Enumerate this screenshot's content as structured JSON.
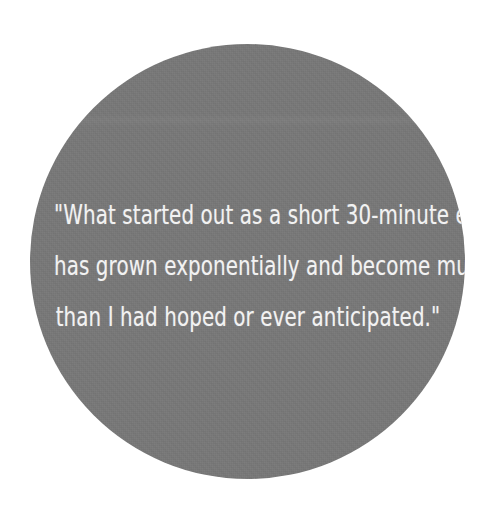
{
  "page": {
    "background_color": "#ffffff",
    "width": 488,
    "height": 520
  },
  "circle": {
    "name": "gray-circle-badge",
    "fill_color": "#787878",
    "center_x": 247,
    "center_y": 262,
    "diameter": 435
  },
  "quote": {
    "text_color": "#f2f2f2",
    "full_text": "\"What started out as a short 30-minute ebook has grown exponentially and become much more than I had hoped or ever anticipated.\"",
    "lines": [
      "\"What started out as a short 30-minute ebook",
      "has grown exponentially and become much more",
      "than I had hoped or ever anticipated.\""
    ],
    "line_1": "\"What started out as a short 30-minute ebook",
    "line_2": "has grown exponentially and become much more",
    "line_3": "than I had hoped or ever anticipated.\""
  }
}
